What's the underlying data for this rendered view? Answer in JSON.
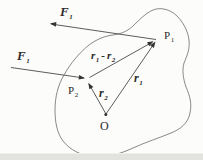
{
  "figure": {
    "type": "physics-vector-diagram",
    "labels": {
      "force_at_p1": {
        "base": "F",
        "sub": "1"
      },
      "force_at_p2": {
        "base": "F",
        "sub": "1"
      },
      "point_p1": {
        "base": "P",
        "sub": "1"
      },
      "point_p2": {
        "base": "P",
        "sub": "2"
      },
      "origin": "O",
      "vector_r1": {
        "base": "r",
        "sub": "1"
      },
      "vector_r2": {
        "base": "r",
        "sub": "2"
      },
      "vector_r1_minus_r2": {
        "base1": "r",
        "sub1": "1",
        "op": "-",
        "base2": "r",
        "sub2": "2"
      }
    },
    "colors": {
      "background": "#fcfcfa",
      "body_outline": "#6b6b68",
      "vector_line": "#4a4a4a",
      "arrowhead": "#333333",
      "text": "#2b2b2b",
      "bottom_edge_shadow": "#e2e2df"
    }
  }
}
